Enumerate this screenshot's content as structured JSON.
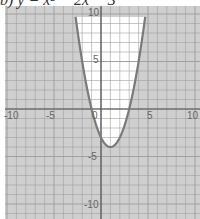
{
  "title": "b) y = x² − 2x − 3",
  "chart_data": {
    "type": "line",
    "title": "b) y = x² − 2x − 3",
    "function": "y = x^2 - 2x - 3",
    "xlabel": "",
    "ylabel": "",
    "xlim": [
      -10.5,
      10.5
    ],
    "ylim": [
      -11,
      10.5
    ],
    "x_ticks": [
      -10,
      -5,
      0,
      5,
      10
    ],
    "y_ticks": [
      -10,
      -5,
      5,
      10
    ],
    "grid": true,
    "grid_step": 1,
    "vertex": [
      1,
      -4
    ],
    "roots": [
      -1,
      3
    ],
    "y_intercept": -3,
    "shading": "region outside parabola (y < x^2 - 2x - 3) shaded gray",
    "series": [
      {
        "name": "y = x^2 - 2x - 3",
        "x": [
          -2.5,
          -2,
          -1,
          0,
          1,
          2,
          3,
          4,
          4.5
        ],
        "y": [
          8.25,
          5,
          0,
          -3,
          -4,
          -3,
          0,
          5,
          8.25
        ]
      }
    ]
  },
  "colors": {
    "shade": "#c8c8c8",
    "grid": "#9a9a9a",
    "axis": "#555555",
    "curve": "#777777",
    "label": "#666666"
  }
}
